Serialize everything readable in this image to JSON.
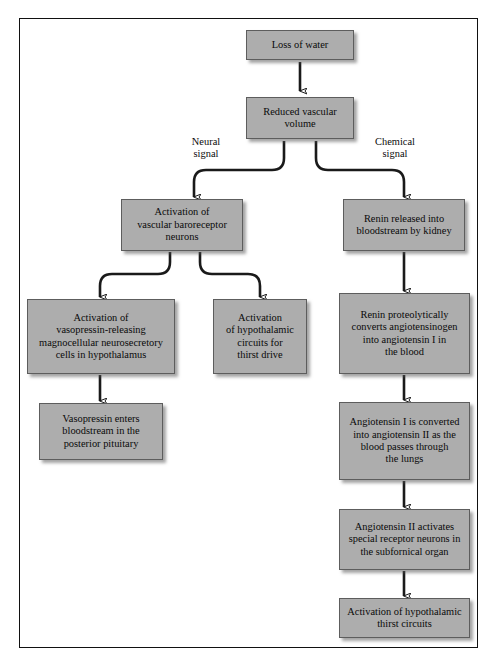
{
  "figure": {
    "frame_color": "#111111",
    "node_fill": "#adadad",
    "node_border": "#5d5d5d",
    "arrow_color": "#1a1a1a"
  },
  "nodes": {
    "loss_of_water": "Loss of water",
    "reduced_vascular_volume": "Reduced vascular\nvolume",
    "baroreceptor_neurons": "Activation of\nvascular baroreceptor\nneurons",
    "renin_released": "Renin released into\nbloodstream by kidney",
    "vasopressin_cells": "Activation of\nvasopressin-releasing\nmagnocellular neurosecretory\ncells in hypothalamus",
    "thirst_circuits_left": "Activation\nof hypothalamic\ncircuits for\nthirst drive",
    "renin_converts": "Renin proteolytically\nconverts angiotensinogen\ninto angiotensin I in\nthe blood",
    "vasopressin_enters": "Vasopressin enters\nbloodstream in the\nposterior pituitary",
    "angiotensin_i_converted": "Angiotensin I is converted\ninto angiotensin II as the\nblood passes through\nthe lungs",
    "angiotensin_ii_activates": "Angiotensin II activates\nspecial receptor neurons in\nthe subfornical organ",
    "thirst_circuits_right": "Activation of hypothalamic\nthirst circuits"
  },
  "edge_labels": {
    "neural_signal": "Neural\nsignal",
    "chemical_signal": "Chemical\nsignal"
  }
}
